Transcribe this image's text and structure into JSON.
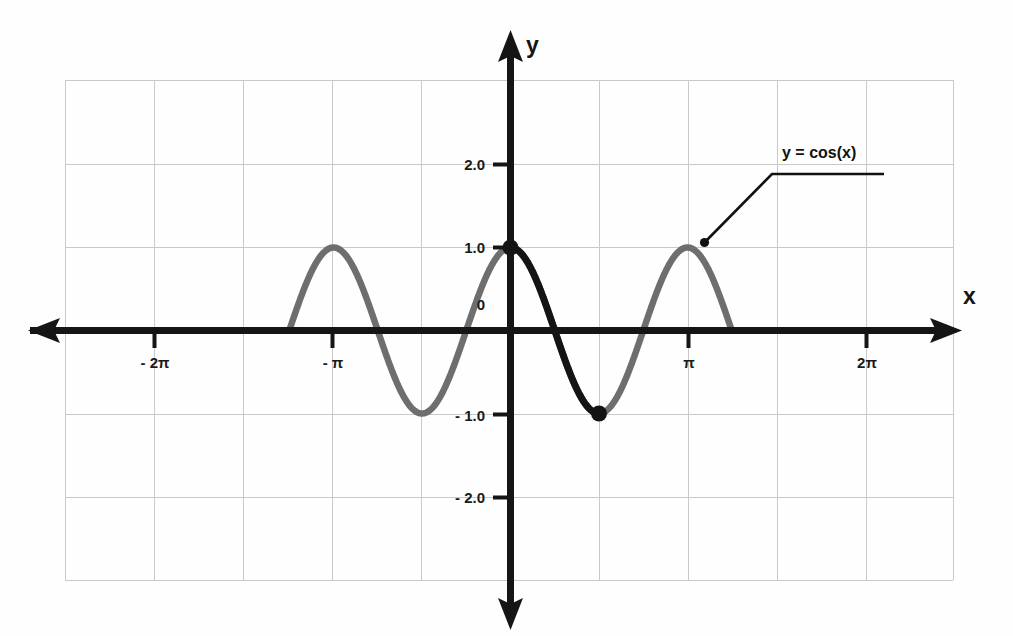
{
  "chart_data": {
    "type": "line",
    "title": "",
    "subtitle": "",
    "xlabel": "x",
    "ylabel": "y",
    "function": "y = cos(x)",
    "xlim": [
      -7.854,
      7.854
    ],
    "ylim": [
      -2.95,
      2.95
    ],
    "grid": true,
    "grid_color": "#c9c9c9",
    "axis_color": "#151515",
    "curve_color": "#6e6e6e",
    "highlight_color": "#141414",
    "legend_position": "none",
    "x_tick_values": [
      -6.2832,
      -3.1416,
      3.1416,
      6.2832
    ],
    "x_tick_labels": [
      "- 2π",
      "- π",
      "π",
      "2π"
    ],
    "y_tick_values": [
      2.0,
      1.0,
      0,
      -1.0,
      -2.0
    ],
    "y_tick_labels": [
      "2.0",
      "1.0",
      "0",
      "- 1.0",
      "- 2.0"
    ],
    "series": [
      {
        "name": "y = cos(x)",
        "color": "#6e6e6e",
        "x_start": -7.854,
        "x_end": 7.854,
        "amplitude": 1.0,
        "period": 6.2832,
        "phase": 0
      },
      {
        "name": "highlighted principal period",
        "color": "#141414",
        "x_start": 0,
        "x_end": 3.1416,
        "amplitude": 1.0,
        "period": 6.2832,
        "phase": 0
      }
    ],
    "marked_points": [
      {
        "x": 0,
        "y": 1.0,
        "label": "(0, 1)"
      },
      {
        "x": 3.1416,
        "y": -1.0,
        "label": "(π, -1)"
      }
    ],
    "annotations": [
      {
        "text": "y = cos(x)",
        "points_to_x": 6.2832,
        "points_to_y": 1.0
      }
    ]
  },
  "axes": {
    "x_axis_label": "x",
    "y_axis_label": "y"
  },
  "annotation": {
    "series_label": "y = cos(x)"
  },
  "y_ticks": [
    {
      "label": "2.0"
    },
    {
      "label": "1.0"
    },
    {
      "label": "0"
    },
    {
      "label": "- 1.0"
    },
    {
      "label": "- 2.0"
    }
  ],
  "x_ticks": [
    {
      "label": "- 2π"
    },
    {
      "label": "- π"
    },
    {
      "label": "π"
    },
    {
      "label": "2π"
    }
  ]
}
